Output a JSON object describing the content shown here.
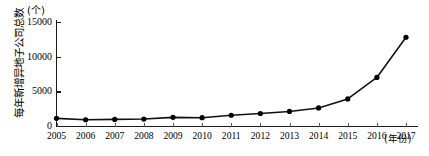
{
  "chart_data": {
    "type": "line",
    "title": "",
    "xlabel": "(年份)",
    "ylabel": "每年新增异地子公司总数",
    "unit": "(个)",
    "categories": [
      "2005",
      "2006",
      "2007",
      "2008",
      "2009",
      "2010",
      "2011",
      "2012",
      "2013",
      "2014",
      "2015",
      "2016",
      "2017"
    ],
    "values": [
      1100,
      900,
      950,
      1000,
      1250,
      1200,
      1550,
      1800,
      2100,
      2600,
      3900,
      7000,
      12800
    ],
    "series": [
      {
        "name": "每年新增异地子公司总数",
        "values": [
          1100,
          900,
          950,
          1000,
          1250,
          1200,
          1550,
          1800,
          2100,
          2600,
          3900,
          7000,
          12800
        ]
      }
    ],
    "ylim": [
      0,
      15000
    ],
    "yticks": [
      0,
      5000,
      10000,
      15000
    ],
    "ytick_labels": [
      "0",
      "5000",
      "10000",
      "15000"
    ],
    "grid": false,
    "legend": "none",
    "marker": "filled-circle",
    "line_color": "#111111",
    "marker_color": "#000000"
  },
  "axis": {
    "y_title": "每年新增异地子公司总数",
    "y_unit": "(个)",
    "x_title": "(年份)"
  }
}
